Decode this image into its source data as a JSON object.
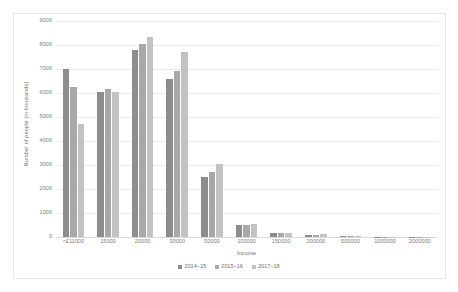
{
  "chart_data": {
    "type": "bar",
    "title": "",
    "subtitle": "",
    "xlabel": "Income",
    "ylabel": "Number of people (in thousands)",
    "ylim": [
      0,
      9000
    ],
    "ytick_step": 1000,
    "yticks": [
      0,
      1000,
      2000,
      3000,
      4000,
      5000,
      6000,
      7000,
      8000,
      9000
    ],
    "grid": true,
    "legend_position": "bottom",
    "categories": [
      "<£11000",
      "15000",
      "20000",
      "30000",
      "50000",
      "100000",
      "150000",
      "200000",
      "500000",
      "1000000",
      "2000000"
    ],
    "series": [
      {
        "name": "2014–15",
        "color": "#8d8d8d",
        "values": [
          7000,
          6050,
          7800,
          6600,
          2500,
          480,
          150,
          95,
          30,
          12,
          6
        ]
      },
      {
        "name": "2015–16",
        "color": "#a8a8a8",
        "values": [
          6250,
          6150,
          8050,
          6900,
          2700,
          500,
          155,
          100,
          32,
          13,
          6
        ]
      },
      {
        "name": "2017–18",
        "color": "#c2c2c2",
        "values": [
          4700,
          6050,
          8350,
          7700,
          3050,
          540,
          165,
          105,
          34,
          14,
          7
        ]
      }
    ]
  },
  "colors": {
    "series_2014_15": "#8d8d8d",
    "series_2015_16": "#a8a8a8",
    "series_2017_18": "#c2c2c2",
    "gridline": "#eceaea",
    "axis_text": "#7d7d7d",
    "frame_border": "#e6e6e6",
    "background": "#ffffff"
  }
}
